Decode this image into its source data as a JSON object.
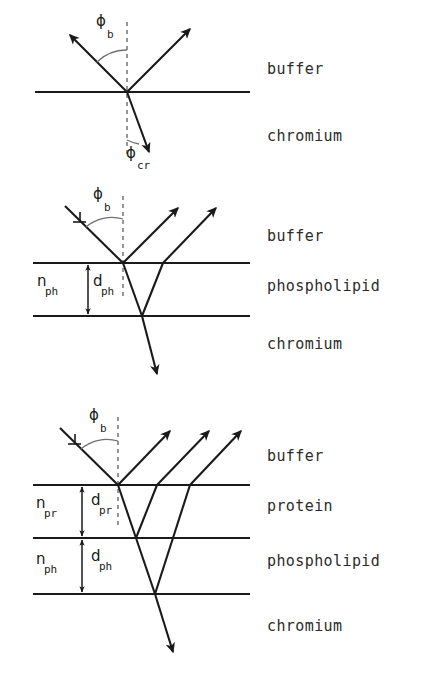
{
  "figure": {
    "ink_color": "#1a1a1a",
    "background_color": "#ffffff",
    "dashed_color": "#6a6a6a"
  },
  "panels": [
    {
      "id": "panel-1",
      "name": "bare-chromium",
      "layer_labels": [
        {
          "text": "buffer",
          "x": 267,
          "y": 74
        },
        {
          "text": "chromium",
          "x": 267,
          "y": 141
        }
      ],
      "angle_labels": [
        {
          "symbol": "ϕ",
          "subscript": "b",
          "sym_x": 96,
          "sym_y": 26,
          "sub_x": 107,
          "sub_y": 38
        },
        {
          "symbol": "ϕ",
          "subscript": "cr",
          "sym_x": 126,
          "sym_y": 158,
          "sub_x": 137,
          "sub_y": 169
        }
      ],
      "interfaces": [
        {
          "name": "buffer-chromium-interface",
          "x1": 35,
          "x2": 250,
          "y": 92
        }
      ],
      "rays": [
        {
          "name": "incident-ray",
          "x1": 66,
          "y1": 31,
          "x2": 127,
          "y2": 92,
          "arrow": "start"
        },
        {
          "name": "reflected-ray",
          "x1": 127,
          "y1": 92,
          "x2": 193,
          "y2": 26,
          "arrow": "end"
        },
        {
          "name": "refracted-ray",
          "x1": 127,
          "y1": 92,
          "x2": 150,
          "y2": 155,
          "arrow": "end"
        }
      ],
      "normal": {
        "name": "surface-normal",
        "x": 127,
        "y1": 22,
        "y2": 158
      }
    },
    {
      "id": "panel-2",
      "name": "phospholipid-layer",
      "layer_labels": [
        {
          "text": "buffer",
          "x": 267,
          "y": 241
        },
        {
          "text": "phospholipid",
          "x": 267,
          "y": 291
        },
        {
          "text": "chromium",
          "x": 267,
          "y": 349
        }
      ],
      "angle_labels": [
        {
          "symbol": "ϕ",
          "subscript": "b",
          "sym_x": 93,
          "sym_y": 199,
          "sub_x": 104,
          "sub_y": 211
        }
      ],
      "index_labels": [
        {
          "symbol": "n",
          "subscript": "ph",
          "sym_x": 37,
          "sym_y": 286,
          "sub_x": 46,
          "sub_y": 293
        }
      ],
      "thickness_labels": [
        {
          "symbol": "d",
          "subscript": "ph",
          "sym_x": 93,
          "sym_y": 286,
          "sub_x": 102,
          "sub_y": 293
        }
      ],
      "interfaces": [
        {
          "name": "buffer-phospholipid-interface",
          "x1": 33,
          "x2": 250,
          "y": 263
        },
        {
          "name": "phospholipid-chromium-interface",
          "x1": 33,
          "x2": 250,
          "y": 316
        }
      ],
      "rays": [
        {
          "name": "incident-ray",
          "x1": 65,
          "y1": 206,
          "x2": 123,
          "y2": 263,
          "arrow": "none"
        },
        {
          "name": "reflected-ray-1",
          "x1": 123,
          "y1": 263,
          "x2": 180,
          "y2": 206,
          "arrow": "end"
        },
        {
          "name": "transmitted-ray",
          "x1": 123,
          "y1": 263,
          "x2": 142,
          "y2": 316,
          "arrow": "none"
        },
        {
          "name": "internal-ray-up",
          "x1": 142,
          "y1": 316,
          "x2": 163,
          "y2": 263,
          "arrow": "none"
        },
        {
          "name": "reflected-ray-2",
          "x1": 163,
          "y1": 263,
          "x2": 218,
          "y2": 206,
          "arrow": "end"
        },
        {
          "name": "refracted-ray-chromium",
          "x1": 142,
          "y1": 316,
          "x2": 158,
          "y2": 378,
          "arrow": "end"
        }
      ],
      "normal": {
        "name": "surface-normal",
        "x": 123,
        "y1": 196,
        "y2": 300
      },
      "dimension": {
        "name": "thickness-dimension-ph",
        "x": 88,
        "y1": 263,
        "y2": 316
      }
    },
    {
      "id": "panel-3",
      "name": "protein-and-phospholipid-layers",
      "layer_labels": [
        {
          "text": "buffer",
          "x": 267,
          "y": 461
        },
        {
          "text": "protein",
          "x": 267,
          "y": 511
        },
        {
          "text": "phospholipid",
          "x": 267,
          "y": 566
        },
        {
          "text": "chromium",
          "x": 267,
          "y": 631
        }
      ],
      "angle_labels": [
        {
          "symbol": "ϕ",
          "subscript": "b",
          "sym_x": 89,
          "sym_y": 420,
          "sub_x": 100,
          "sub_y": 432
        }
      ],
      "index_labels": [
        {
          "symbol": "n",
          "subscript": "pr",
          "sym_x": 36,
          "sym_y": 508,
          "sub_x": 45,
          "sub_y": 515
        },
        {
          "symbol": "n",
          "subscript": "ph",
          "sym_x": 36,
          "sym_y": 564,
          "sub_x": 45,
          "sub_y": 571
        }
      ],
      "thickness_labels": [
        {
          "symbol": "d",
          "subscript": "pr",
          "sym_x": 91,
          "sym_y": 505,
          "sub_x": 100,
          "sub_y": 513
        },
        {
          "symbol": "d",
          "subscript": "ph",
          "sym_x": 91,
          "sym_y": 561,
          "sub_x": 100,
          "sub_y": 569
        }
      ],
      "interfaces": [
        {
          "name": "buffer-protein-interface",
          "x1": 33,
          "x2": 250,
          "y": 485
        },
        {
          "name": "protein-phospholipid-interface",
          "x1": 33,
          "x2": 250,
          "y": 538
        },
        {
          "name": "phospholipid-chromium-interface",
          "x1": 33,
          "x2": 250,
          "y": 594
        }
      ],
      "rays": [
        {
          "name": "incident-ray",
          "x1": 60,
          "y1": 428,
          "x2": 118,
          "y2": 485,
          "arrow": "none"
        },
        {
          "name": "reflected-ray-1",
          "x1": 118,
          "y1": 485,
          "x2": 172,
          "y2": 429,
          "arrow": "end"
        },
        {
          "name": "transmitted-ray-protein",
          "x1": 118,
          "y1": 485,
          "x2": 136,
          "y2": 538,
          "arrow": "none"
        },
        {
          "name": "internal-ray-protein-up",
          "x1": 136,
          "y1": 538,
          "x2": 157,
          "y2": 485,
          "arrow": "none"
        },
        {
          "name": "reflected-ray-2",
          "x1": 157,
          "y1": 485,
          "x2": 211,
          "y2": 429,
          "arrow": "end"
        },
        {
          "name": "transmitted-ray-phospholipid",
          "x1": 136,
          "y1": 538,
          "x2": 155,
          "y2": 594,
          "arrow": "none"
        },
        {
          "name": "internal-ray-phospholipid-up",
          "x1": 155,
          "y1": 594,
          "x2": 190,
          "y2": 485,
          "arrow": "none"
        },
        {
          "name": "reflected-ray-3",
          "x1": 190,
          "y1": 485,
          "x2": 243,
          "y2": 429,
          "arrow": "end"
        },
        {
          "name": "refracted-ray-chromium",
          "x1": 155,
          "y1": 594,
          "x2": 174,
          "y2": 656,
          "arrow": "end"
        }
      ],
      "normal": {
        "name": "surface-normal",
        "x": 118,
        "y1": 417,
        "y2": 525
      },
      "dimensions": [
        {
          "name": "thickness-dimension-pr",
          "x": 82,
          "y1": 485,
          "y2": 538
        },
        {
          "name": "thickness-dimension-ph",
          "x": 82,
          "y1": 538,
          "y2": 594
        }
      ]
    }
  ]
}
